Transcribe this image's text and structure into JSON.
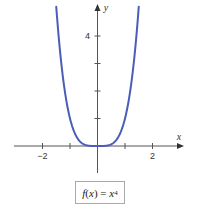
{
  "chart_data": {
    "type": "line",
    "title": "",
    "function": "f(x) = x^4",
    "xlabel": "x",
    "ylabel": "y",
    "xlim": [
      -2.9,
      3.1
    ],
    "ylim": [
      -1,
      5.1
    ],
    "x_ticks": [
      -2,
      -1,
      1,
      2
    ],
    "x_tick_labels": [
      "−2",
      "2"
    ],
    "y_ticks": [
      1,
      2,
      3,
      4
    ],
    "y_tick_labels": [
      "4"
    ],
    "grid": false,
    "legend": null,
    "series": [
      {
        "name": "f(x) = x^4",
        "color": "#4a5db8",
        "x": [
          -1.5,
          -1.4,
          -1.3,
          -1.2,
          -1.1,
          -1.0,
          -0.9,
          -0.8,
          -0.7,
          -0.6,
          -0.5,
          -0.4,
          -0.3,
          -0.2,
          -0.1,
          0,
          0.1,
          0.2,
          0.3,
          0.4,
          0.5,
          0.6,
          0.7,
          0.8,
          0.9,
          1.0,
          1.1,
          1.2,
          1.3,
          1.4,
          1.5
        ],
        "y": [
          5.0625,
          3.8416,
          2.8561,
          2.0736,
          1.4641,
          1.0,
          0.6561,
          0.4096,
          0.2401,
          0.1296,
          0.0625,
          0.0256,
          0.0081,
          0.0016,
          0.0001,
          0,
          0.0001,
          0.0016,
          0.0081,
          0.0256,
          0.0625,
          0.1296,
          0.2401,
          0.4096,
          0.6561,
          1.0,
          1.4641,
          2.0736,
          2.8561,
          3.8416,
          5.0625
        ]
      }
    ]
  },
  "labels": {
    "x_axis": "x",
    "y_axis": "y",
    "tick_neg2": "−2",
    "tick_2": "2",
    "tick_4": "4",
    "formula_fx": "f",
    "formula_paren_open": "(",
    "formula_x": "x",
    "formula_rest": ") = ",
    "formula_base": "x",
    "formula_exp": "4"
  }
}
